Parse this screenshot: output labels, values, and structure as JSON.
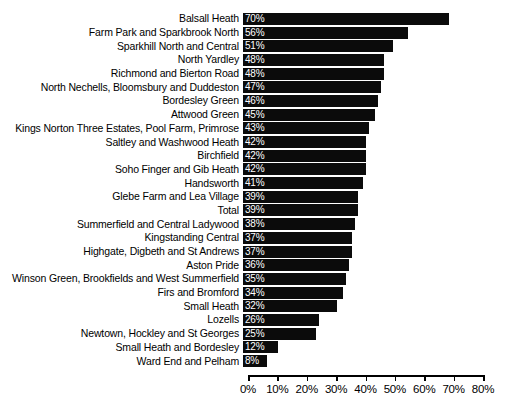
{
  "chart_data": {
    "type": "bar",
    "orientation": "horizontal",
    "title": "",
    "xlabel": "",
    "ylabel": "",
    "xlim": [
      0,
      80
    ],
    "xtick_labels": [
      "0%",
      "10%",
      "20%",
      "30%",
      "40%",
      "50%",
      "60%",
      "70%",
      "80%"
    ],
    "xticks": [
      0,
      10,
      20,
      30,
      40,
      50,
      60,
      70,
      80
    ],
    "grid": false,
    "legend": false,
    "bar_color": "#0b0b0b",
    "value_label_color": "#ffffff",
    "value_suffix": "%",
    "categories": [
      "Balsall Heath",
      "Farm Park and Sparkbrook North",
      "Sparkhill North and Central",
      "North Yardley",
      "Richmond and Bierton Road",
      "North Nechells, Bloomsbury and Duddeston",
      "Bordesley Green",
      "Attwood Green",
      "Kings Norton Three Estates, Pool Farm, Primrose",
      "Saltley and Washwood Heath",
      "Birchfield",
      "Soho Finger and Gib Heath",
      "Handsworth",
      "Glebe Farm and Lea Village",
      "Total",
      "Summerfield and Central Ladywood",
      "Kingstanding Central",
      "Highgate, Digbeth and St Andrews",
      "Aston Pride",
      "Winson Green, Brookfields and West Summerfield",
      "Firs and Bromford",
      "Small Heath",
      "Lozells",
      "Newtown, Hockley and St Georges",
      "Small Heath and Bordesley",
      "Ward End and Pelham"
    ],
    "values": [
      70,
      56,
      51,
      48,
      48,
      47,
      46,
      45,
      43,
      42,
      42,
      42,
      41,
      39,
      39,
      38,
      37,
      37,
      36,
      35,
      34,
      32,
      26,
      25,
      12,
      8
    ],
    "value_labels": [
      "70%",
      "56%",
      "51%",
      "48%",
      "48%",
      "47%",
      "46%",
      "45%",
      "43%",
      "42%",
      "42%",
      "42%",
      "41%",
      "39%",
      "39%",
      "38%",
      "37%",
      "37%",
      "36%",
      "35%",
      "34%",
      "32%",
      "26%",
      "25%",
      "12%",
      "8%"
    ]
  }
}
